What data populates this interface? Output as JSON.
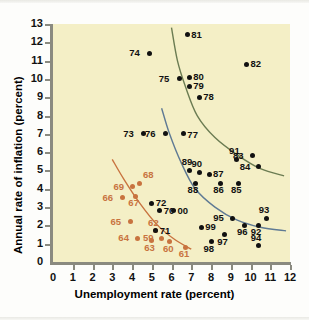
{
  "chart_data": {
    "type": "scatter",
    "title": "",
    "xlabel": "Unemployment rate (percent)",
    "ylabel": "Annual rate of inflation (percent)",
    "xlim": [
      0,
      12
    ],
    "ylim": [
      0,
      13
    ],
    "xticks": [
      "0",
      "1",
      "2",
      "3",
      "4",
      "5",
      "6",
      "7",
      "8",
      "9",
      "10",
      "11",
      "12"
    ],
    "yticks": [
      "0",
      "1",
      "2",
      "3",
      "4",
      "5",
      "6",
      "7",
      "8",
      "9",
      "10",
      "11",
      "12",
      "13"
    ],
    "grid": false,
    "legend": "none",
    "background_color": "#f4efc6",
    "series": [
      {
        "name": "1960s",
        "color": "#c8733f",
        "points": [
          {
            "label": "59",
            "x": 5.5,
            "y": 1.3,
            "lx": -14,
            "ly": -1
          },
          {
            "label": "60",
            "x": 5.9,
            "y": 1.1,
            "lx": -2,
            "ly": 6
          },
          {
            "label": "61",
            "x": 6.7,
            "y": 0.8,
            "lx": -2,
            "ly": 6
          },
          {
            "label": "62",
            "x": 5.2,
            "y": 1.7,
            "lx": -3,
            "ly": -9
          },
          {
            "label": "63",
            "x": 5.0,
            "y": 1.2,
            "lx": -3,
            "ly": 7
          },
          {
            "label": "64",
            "x": 4.3,
            "y": 1.3,
            "lx": -15,
            "ly": -1
          },
          {
            "label": "65",
            "x": 3.9,
            "y": 2.2,
            "lx": -15,
            "ly": -1
          },
          {
            "label": "66",
            "x": 3.5,
            "y": 3.5,
            "lx": -15,
            "ly": -1
          },
          {
            "label": "67",
            "x": 4.2,
            "y": 3.6,
            "lx": -3,
            "ly": 6
          },
          {
            "label": "68",
            "x": 4.4,
            "y": 4.3,
            "lx": 3,
            "ly": -9
          },
          {
            "label": "69",
            "x": 4.0,
            "y": 4.1,
            "lx": -14,
            "ly": -1
          }
        ]
      },
      {
        "name": "1970s-2000s",
        "color": "#111111",
        "points": [
          {
            "label": "70",
            "x": 5.4,
            "y": 2.8,
            "lx": 4,
            "ly": -1
          },
          {
            "label": "71",
            "x": 5.2,
            "y": 1.7,
            "lx": 4,
            "ly": -1
          },
          {
            "label": "72",
            "x": 5.0,
            "y": 3.2,
            "lx": 4,
            "ly": -1
          },
          {
            "label": "73",
            "x": 4.6,
            "y": 7.0,
            "lx": -16,
            "ly": -1
          },
          {
            "label": "74",
            "x": 4.9,
            "y": 11.4,
            "lx": -16,
            "ly": -1
          },
          {
            "label": "75",
            "x": 6.4,
            "y": 10.0,
            "lx": -16,
            "ly": -1
          },
          {
            "label": "76",
            "x": 5.7,
            "y": 7.0,
            "lx": -16,
            "ly": -1
          },
          {
            "label": "77",
            "x": 6.6,
            "y": 7.0,
            "lx": 4,
            "ly": 0
          },
          {
            "label": "78",
            "x": 7.4,
            "y": 9.0,
            "lx": 4,
            "ly": -1
          },
          {
            "label": "79",
            "x": 6.9,
            "y": 9.6,
            "lx": 4,
            "ly": -1
          },
          {
            "label": "80",
            "x": 6.9,
            "y": 10.1,
            "lx": 4,
            "ly": -1
          },
          {
            "label": "81",
            "x": 6.8,
            "y": 12.4,
            "lx": 4,
            "ly": -1
          },
          {
            "label": "82",
            "x": 9.8,
            "y": 10.8,
            "lx": 4,
            "ly": -1
          },
          {
            "label": "83",
            "x": 10.1,
            "y": 5.8,
            "lx": -15,
            "ly": -1
          },
          {
            "label": "84",
            "x": 10.4,
            "y": 5.2,
            "lx": -14,
            "ly": -1
          },
          {
            "label": "85",
            "x": 9.4,
            "y": 4.3,
            "lx": -3,
            "ly": 6
          },
          {
            "label": "86",
            "x": 8.5,
            "y": 4.3,
            "lx": -3,
            "ly": 6
          },
          {
            "label": "87",
            "x": 7.9,
            "y": 4.8,
            "lx": 4,
            "ly": -1
          },
          {
            "label": "88",
            "x": 7.2,
            "y": 4.3,
            "lx": -3,
            "ly": 6
          },
          {
            "label": "89",
            "x": 6.9,
            "y": 5.0,
            "lx": -3,
            "ly": -9
          },
          {
            "label": "90",
            "x": 7.4,
            "y": 4.9,
            "lx": -3,
            "ly": -9
          },
          {
            "label": "91",
            "x": 9.3,
            "y": 5.6,
            "lx": -3,
            "ly": -9
          },
          {
            "label": "92",
            "x": 10.4,
            "y": 2.0,
            "lx": -3,
            "ly": 6
          },
          {
            "label": "93",
            "x": 10.8,
            "y": 2.4,
            "lx": -3,
            "ly": -9
          },
          {
            "label": "94",
            "x": 10.4,
            "y": 0.9,
            "lx": -3,
            "ly": -9
          },
          {
            "label": "95",
            "x": 9.1,
            "y": 2.4,
            "lx": -15,
            "ly": -1
          },
          {
            "label": "96",
            "x": 9.7,
            "y": 2.0,
            "lx": -3,
            "ly": 6
          },
          {
            "label": "97",
            "x": 8.7,
            "y": 1.5,
            "lx": -3,
            "ly": 6
          },
          {
            "label": "98",
            "x": 8.0,
            "y": 1.1,
            "lx": -3,
            "ly": 6
          },
          {
            "label": "99",
            "x": 7.5,
            "y": 1.9,
            "lx": 4,
            "ly": -1
          },
          {
            "label": "00",
            "x": 6.1,
            "y": 2.8,
            "lx": 4,
            "ly": -1
          }
        ]
      }
    ],
    "curves": [
      {
        "name": "phillips-curve-1960s",
        "color": "#c8733f",
        "path": [
          [
            3.0,
            5.6
          ],
          [
            3.6,
            4.5
          ],
          [
            4.4,
            3.2
          ],
          [
            5.3,
            2.0
          ],
          [
            6.2,
            1.2
          ],
          [
            7.0,
            0.7
          ]
        ]
      },
      {
        "name": "phillips-curve-1970s",
        "color": "#5f7a94",
        "path": [
          [
            5.5,
            8.4
          ],
          [
            5.9,
            7.0
          ],
          [
            6.5,
            5.4
          ],
          [
            7.2,
            4.0
          ],
          [
            8.2,
            3.0
          ],
          [
            9.3,
            2.3
          ],
          [
            10.5,
            1.9
          ],
          [
            11.8,
            1.7
          ]
        ]
      },
      {
        "name": "phillips-curve-1980s",
        "color": "#6b7c52",
        "path": [
          [
            6.0,
            12.8
          ],
          [
            6.3,
            11.0
          ],
          [
            6.7,
            9.6
          ],
          [
            7.3,
            8.0
          ],
          [
            8.2,
            6.8
          ],
          [
            9.4,
            5.8
          ],
          [
            10.5,
            5.1
          ],
          [
            11.7,
            4.7
          ]
        ]
      }
    ]
  }
}
